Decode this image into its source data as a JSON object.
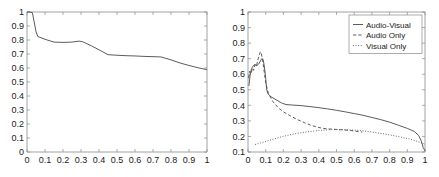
{
  "figure": {
    "background": "#ffffff",
    "axis_color": "#8a8a8a",
    "line_color": "#4a4a4a",
    "text_color": "#1a1a1a"
  },
  "chart_data": [
    {
      "id": "left",
      "type": "line",
      "title": "",
      "xlabel": "",
      "ylabel": "",
      "xlim": [
        0,
        1
      ],
      "ylim": [
        0,
        1
      ],
      "xticks": [
        0,
        0.1,
        0.2,
        0.3,
        0.4,
        0.5,
        0.6,
        0.7,
        0.8,
        0.9,
        1
      ],
      "yticks": [
        0,
        0.1,
        0.2,
        0.3,
        0.4,
        0.5,
        0.6,
        0.7,
        0.8,
        0.9,
        1
      ],
      "xtick_labels": [
        "0",
        "0.1",
        "0.2",
        "0.3",
        "0.4",
        "0.5",
        "0.6",
        "0.7",
        "0.8",
        "0.9",
        "1"
      ],
      "ytick_labels": [
        "0",
        "0.1",
        "0.2",
        "0.3",
        "0.4",
        "0.5",
        "0.6",
        "0.7",
        "0.8",
        "0.9",
        "1"
      ],
      "grid": false,
      "legend": null,
      "series": [
        {
          "name": "curve",
          "style": "solid",
          "x": [
            0.0,
            0.015,
            0.03,
            0.05,
            0.06,
            0.1,
            0.15,
            0.2,
            0.25,
            0.29,
            0.31,
            0.36,
            0.41,
            0.45,
            0.5,
            0.55,
            0.6,
            0.65,
            0.7,
            0.745,
            0.8,
            0.85,
            0.9,
            0.95,
            1.0
          ],
          "y": [
            1.0,
            1.0,
            0.995,
            0.86,
            0.825,
            0.805,
            0.785,
            0.783,
            0.785,
            0.792,
            0.787,
            0.757,
            0.723,
            0.695,
            0.691,
            0.688,
            0.686,
            0.683,
            0.681,
            0.679,
            0.658,
            0.636,
            0.618,
            0.602,
            0.588
          ]
        }
      ]
    },
    {
      "id": "right",
      "type": "line",
      "title": "",
      "xlabel": "",
      "ylabel": "",
      "xlim": [
        0,
        1
      ],
      "ylim": [
        0.1,
        1
      ],
      "xticks": [
        0,
        0.1,
        0.2,
        0.3,
        0.4,
        0.5,
        0.6,
        0.7,
        0.8,
        0.9,
        1
      ],
      "yticks": [
        0.1,
        0.2,
        0.3,
        0.4,
        0.5,
        0.6,
        0.7,
        0.8,
        0.9,
        1
      ],
      "xtick_labels": [
        "0",
        "0.1",
        "0.2",
        "0.3",
        "0.4",
        "0.5",
        "0.6",
        "0.7",
        "0.8",
        "0.9",
        "1"
      ],
      "ytick_labels": [
        "0.1",
        "0.2",
        "0.3",
        "0.4",
        "0.5",
        "0.6",
        "0.7",
        "0.8",
        "0.9",
        "1"
      ],
      "grid": false,
      "legend": {
        "position": "top-right",
        "entries": [
          {
            "label": "Audio-Visual",
            "style": "solid"
          },
          {
            "label": "Audio Only",
            "style": "dashed"
          },
          {
            "label": "Visual Only",
            "style": "dotted"
          }
        ]
      },
      "series": [
        {
          "name": "Audio-Visual",
          "style": "solid",
          "x": [
            0.005,
            0.012,
            0.02,
            0.03,
            0.04,
            0.05,
            0.06,
            0.07,
            0.078,
            0.085,
            0.092,
            0.1,
            0.105,
            0.112,
            0.13,
            0.16,
            0.19,
            0.215,
            0.25,
            0.3,
            0.35,
            0.4,
            0.45,
            0.5,
            0.55,
            0.6,
            0.65,
            0.7,
            0.75,
            0.8,
            0.85,
            0.9,
            0.94,
            0.965,
            0.98,
            0.99,
            1.0
          ],
          "y": [
            0.525,
            0.595,
            0.635,
            0.655,
            0.66,
            0.655,
            0.665,
            0.685,
            0.7,
            0.695,
            0.655,
            0.575,
            0.505,
            0.475,
            0.455,
            0.435,
            0.415,
            0.405,
            0.402,
            0.398,
            0.392,
            0.385,
            0.377,
            0.368,
            0.358,
            0.347,
            0.336,
            0.322,
            0.308,
            0.292,
            0.272,
            0.252,
            0.232,
            0.205,
            0.168,
            0.128,
            0.108
          ]
        },
        {
          "name": "Audio Only",
          "style": "dashed",
          "x": [
            0.003,
            0.01,
            0.018,
            0.025,
            0.032,
            0.04,
            0.048,
            0.055,
            0.062,
            0.07,
            0.075,
            0.082,
            0.09,
            0.1,
            0.115,
            0.14,
            0.17,
            0.2,
            0.24,
            0.28,
            0.32,
            0.355,
            0.385,
            0.42,
            0.46,
            0.5,
            0.54,
            0.58,
            0.615,
            0.645
          ],
          "y": [
            0.575,
            0.62,
            0.605,
            0.64,
            0.625,
            0.665,
            0.655,
            0.69,
            0.715,
            0.745,
            0.735,
            0.695,
            0.63,
            0.545,
            0.478,
            0.425,
            0.385,
            0.358,
            0.332,
            0.308,
            0.288,
            0.272,
            0.262,
            0.252,
            0.248,
            0.245,
            0.242,
            0.238,
            0.232,
            0.228
          ]
        },
        {
          "name": "Visual Only",
          "style": "dotted",
          "x": [
            0.04,
            0.07,
            0.1,
            0.13,
            0.16,
            0.19,
            0.22,
            0.25,
            0.28,
            0.31,
            0.34,
            0.37,
            0.4,
            0.43,
            0.46,
            0.49,
            0.52,
            0.55,
            0.58,
            0.61,
            0.64,
            0.67,
            0.7,
            0.73,
            0.76,
            0.79,
            0.82,
            0.85,
            0.88,
            0.91,
            0.94,
            0.97,
            1.0
          ],
          "y": [
            0.148,
            0.158,
            0.168,
            0.178,
            0.188,
            0.198,
            0.206,
            0.214,
            0.22,
            0.226,
            0.23,
            0.234,
            0.238,
            0.241,
            0.243,
            0.244,
            0.244,
            0.243,
            0.242,
            0.24,
            0.237,
            0.233,
            0.228,
            0.223,
            0.218,
            0.212,
            0.206,
            0.199,
            0.192,
            0.184,
            0.175,
            0.163,
            0.15
          ]
        }
      ]
    }
  ]
}
